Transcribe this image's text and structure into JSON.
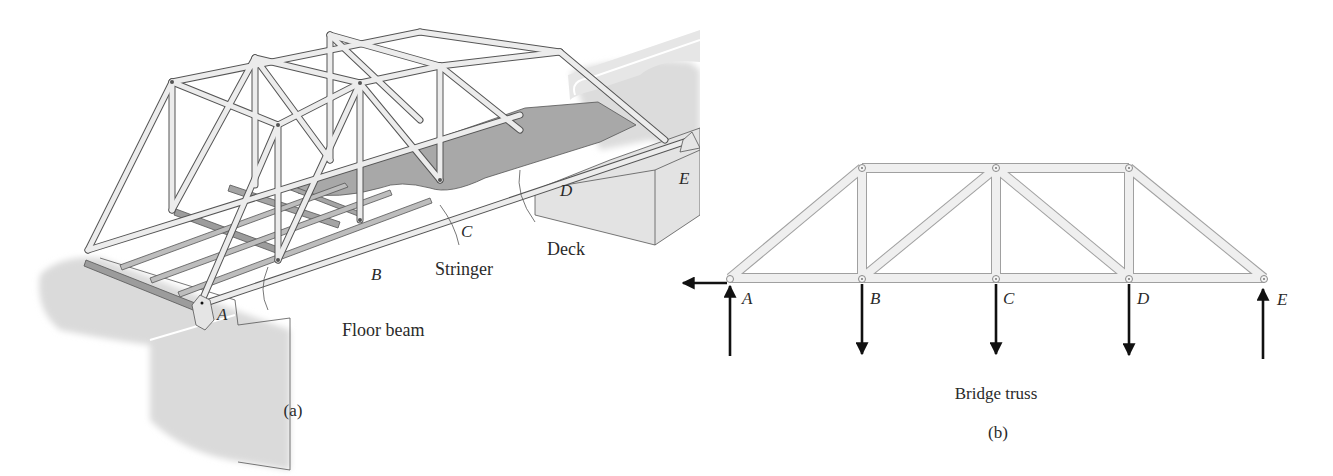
{
  "figure_a": {
    "caption": "(a)",
    "node_labels": [
      "A",
      "B",
      "C",
      "D",
      "E"
    ],
    "callouts": {
      "floor_beam": "Floor beam",
      "stringer": "Stringer",
      "deck": "Deck"
    }
  },
  "figure_b": {
    "title": "Bridge truss",
    "caption": "(b)",
    "node_labels": [
      "A",
      "B",
      "C",
      "D",
      "E"
    ],
    "loads": {
      "A": [
        "horizontal-left reaction",
        "vertical-up reaction"
      ],
      "B": [
        "vertical-down load"
      ],
      "C": [
        "vertical-down load"
      ],
      "D": [
        "vertical-down load"
      ],
      "E": [
        "vertical-up reaction"
      ]
    }
  },
  "colors": {
    "member_fill": "#eeeeee",
    "member_stroke": "#9a9a9a",
    "abutment_fill": "#dcdcdc",
    "deck_fill": "#a8a8a8",
    "floor_beam_fill": "#9c9c9c",
    "arrow": "#111111"
  }
}
